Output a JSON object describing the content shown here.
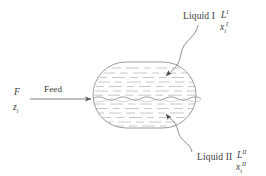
{
  "figure": {
    "type": "process-flow-diagram",
    "background_color": "#ffffff",
    "line_color": "#6e6e6e",
    "text_color": "#3a3a3a"
  },
  "vessel": {
    "name": "liquid-liquid-separator",
    "shape": "horizontal-capsule",
    "x": 93,
    "y": 62,
    "width": 103,
    "height": 66,
    "interface_y": 98,
    "interface_style": "wavy",
    "fill_texture": "horizontal-dashes"
  },
  "streams": {
    "feed": {
      "label": "Feed",
      "flow_symbol": "F",
      "composition_symbol": "z",
      "composition_subscript": "i",
      "arrow_from_x": 30,
      "arrow_to_x": 93,
      "arrow_y": 99
    },
    "liquid1": {
      "label": "Liquid I",
      "flow_symbol": "L",
      "flow_superscript": "I",
      "composition_symbol": "x",
      "composition_subscript": "i",
      "composition_superscript": "I",
      "phase": "upper"
    },
    "liquid2": {
      "label": "Liquid II",
      "flow_symbol": "L",
      "flow_superscript": "II",
      "composition_symbol": "x",
      "composition_subscript": "i",
      "composition_superscript": "II",
      "phase": "lower"
    }
  }
}
